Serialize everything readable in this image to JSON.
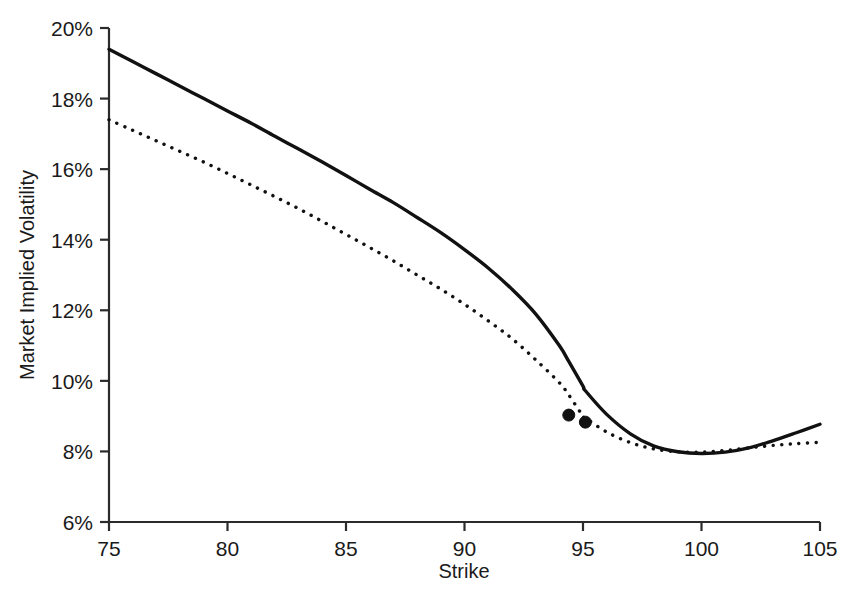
{
  "chart_data": {
    "type": "line",
    "title": "",
    "xlabel": "Strike",
    "ylabel": "Market Implied Volatility",
    "xlim": [
      75,
      105
    ],
    "ylim": [
      6,
      20
    ],
    "xticks": [
      75,
      80,
      85,
      90,
      95,
      100,
      105
    ],
    "xticklabels": [
      "75",
      "80",
      "85",
      "90",
      "95",
      "100",
      "105"
    ],
    "yticks": [
      6,
      8,
      10,
      12,
      14,
      16,
      18,
      20
    ],
    "yticklabels": [
      "6%",
      "8%",
      "10%",
      "12%",
      "14%",
      "16%",
      "18%",
      "20%"
    ],
    "grid": false,
    "legend": "none",
    "y_unit": "percent",
    "series": [
      {
        "name": "solid-curve",
        "style": "solid",
        "color": "#111111",
        "linewidth": 3.4,
        "x": [
          75,
          76,
          77,
          78,
          79,
          80,
          81,
          82,
          83,
          84,
          85,
          86,
          87,
          88,
          89,
          90,
          91,
          92,
          93,
          94,
          94.4,
          95,
          95.1,
          96,
          97,
          98,
          99,
          100,
          101,
          102,
          103,
          104,
          105
        ],
        "y": [
          19.4,
          19.05,
          18.7,
          18.35,
          18.0,
          17.65,
          17.3,
          16.93,
          16.57,
          16.2,
          15.82,
          15.43,
          15.05,
          14.63,
          14.2,
          13.72,
          13.2,
          12.6,
          11.9,
          11.0,
          10.55,
          9.85,
          9.72,
          9.05,
          8.5,
          8.15,
          7.99,
          7.94,
          7.98,
          8.1,
          8.3,
          8.53,
          8.77
        ]
      },
      {
        "name": "dotted-curve",
        "style": "dotted",
        "color": "#111111",
        "linewidth": 3.4,
        "x": [
          75,
          76,
          77,
          78,
          79,
          80,
          81,
          82,
          83,
          84,
          85,
          86,
          87,
          88,
          89,
          90,
          91,
          92,
          93,
          94,
          94.4,
          95,
          95.1,
          96,
          97,
          98,
          99,
          100,
          101,
          102,
          103,
          104,
          105
        ],
        "y": [
          17.4,
          17.1,
          16.8,
          16.5,
          16.2,
          15.88,
          15.55,
          15.22,
          14.88,
          14.52,
          14.15,
          13.78,
          13.4,
          13.0,
          12.6,
          12.17,
          11.7,
          11.2,
          10.6,
          9.95,
          9.6,
          9.0,
          8.95,
          8.55,
          8.25,
          8.07,
          7.99,
          7.98,
          8.03,
          8.1,
          8.17,
          8.22,
          8.26
        ]
      }
    ],
    "markers": [
      {
        "name": "crossing-marker-1",
        "x": 94.4,
        "y": 9.03,
        "shape": "circle",
        "size": 9,
        "color": "#111111"
      },
      {
        "name": "crossing-marker-2",
        "x": 95.1,
        "y": 8.83,
        "shape": "circle",
        "size": 9,
        "color": "#111111"
      }
    ]
  },
  "axes": {
    "x_title": "Strike",
    "y_title": "Market Implied Volatility",
    "axis_color": "#2b2b2b"
  }
}
